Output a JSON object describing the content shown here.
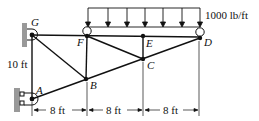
{
  "diagram": {
    "type": "truss",
    "joints": {
      "A": {
        "label": "A",
        "x": 32,
        "y": 99
      },
      "B": {
        "label": "B",
        "x": 86,
        "y": 79
      },
      "C": {
        "label": "C",
        "x": 143,
        "y": 59
      },
      "D": {
        "label": "D",
        "x": 200,
        "y": 38
      },
      "E": {
        "label": "E",
        "x": 143,
        "y": 36
      },
      "F": {
        "label": "F",
        "x": 87,
        "y": 36
      },
      "G": {
        "label": "G",
        "x": 32,
        "y": 35
      }
    },
    "members": [
      [
        "G",
        "F"
      ],
      [
        "F",
        "E"
      ],
      [
        "E",
        "D"
      ],
      [
        "G",
        "A"
      ],
      [
        "A",
        "B"
      ],
      [
        "B",
        "C"
      ],
      [
        "C",
        "D"
      ],
      [
        "G",
        "B"
      ],
      [
        "F",
        "B"
      ],
      [
        "F",
        "C"
      ],
      [
        "E",
        "C"
      ]
    ],
    "load": {
      "label": "1000 lb/ft",
      "from": "F",
      "to": "D",
      "type": "distributed"
    },
    "dimensions": {
      "height": "10 ft",
      "spans": [
        "8 ft",
        "8 ft",
        "8 ft"
      ]
    },
    "supports": {
      "G": "pin",
      "A": "roller",
      "F": "hinge",
      "D": "hinge"
    }
  }
}
